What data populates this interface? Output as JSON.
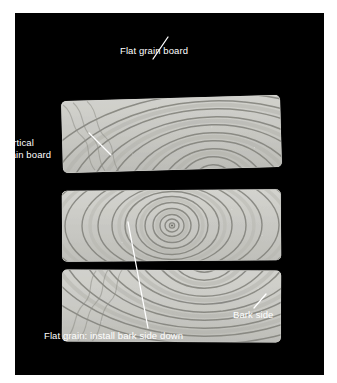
{
  "figure": {
    "background_color": "#ffffff",
    "photo_background_color": "#000000",
    "wood_color": "#c9c9c4",
    "ring_color": "#7e7e76",
    "label_color": "#ffffff",
    "leader_color": "#ffffff"
  },
  "labels": {
    "flat_grain_board": "Flat grain board",
    "vertical_grain_board_line1": "Vertical",
    "vertical_grain_board_line2": "grain board",
    "flat_grain_install": "Flat grain: install bark side down",
    "bark_side": "Bark side"
  },
  "boards": [
    {
      "id": "board-top",
      "name": "Flat grain board",
      "grain_type": "flat grain",
      "ring_pattern": "arched rings curving upward, pith below the board",
      "ring_count": 11
    },
    {
      "id": "board-middle",
      "name": "Vertical grain board",
      "grain_type": "vertical grain",
      "ring_pattern": "concentric rings with pith centered in the board",
      "ring_count": 12
    },
    {
      "id": "board-bottom",
      "name": "Flat grain board, bark side down",
      "grain_type": "flat grain",
      "ring_pattern": "arched rings curving downward, pith above the board",
      "ring_count": 11
    }
  ]
}
